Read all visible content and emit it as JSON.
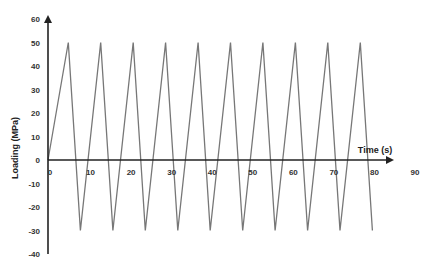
{
  "chart_data": {
    "type": "line",
    "title": "",
    "xlabel": "Time (s)",
    "ylabel": "Loading (MPa)",
    "xlim": [
      0,
      90
    ],
    "ylim": [
      -40,
      60
    ],
    "xticks": [
      0,
      10,
      20,
      30,
      40,
      50,
      60,
      70,
      80,
      90
    ],
    "yticks": [
      60,
      50,
      40,
      30,
      20,
      10,
      0,
      -10,
      -20,
      -30,
      -40
    ],
    "grid": false,
    "legend": null,
    "line_color": "#777777",
    "axis_color": "#222222",
    "series": [
      {
        "name": "Cyclic loading",
        "x": [
          0,
          5,
          8,
          13,
          16,
          21,
          24,
          29,
          32,
          37,
          40,
          45,
          48,
          53,
          56,
          61,
          64,
          69,
          72,
          77,
          80
        ],
        "y": [
          0,
          50,
          -30,
          50,
          -30,
          50,
          -30,
          50,
          -30,
          50,
          -30,
          50,
          -30,
          50,
          -30,
          50,
          -30,
          50,
          -30,
          50,
          -30
        ]
      }
    ]
  }
}
